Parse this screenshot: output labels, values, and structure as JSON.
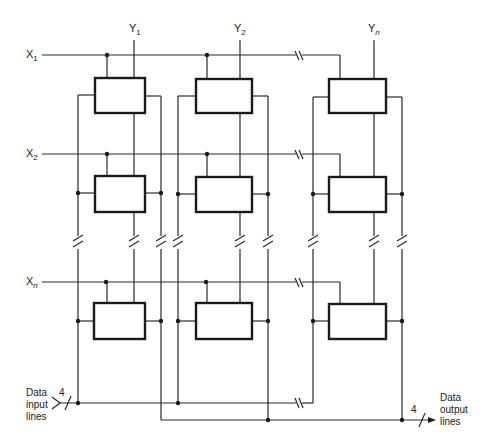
{
  "diagram": {
    "row_labels": [
      {
        "letter": "X",
        "sub": "1"
      },
      {
        "letter": "X",
        "sub": "2"
      },
      {
        "letter": "X",
        "sub": "n"
      }
    ],
    "column_labels": [
      {
        "letter": "Y",
        "sub": "1"
      },
      {
        "letter": "Y",
        "sub": "2"
      },
      {
        "letter": "Y",
        "sub": "n"
      }
    ],
    "data_input": {
      "lines": [
        "Data",
        "input",
        "lines"
      ],
      "width": "4"
    },
    "data_output": {
      "lines": [
        "Data",
        "output",
        "lines"
      ],
      "width": "4"
    },
    "cells": {
      "rows": 3,
      "columns": 3,
      "note": "rows X1, X2, Xn × columns Y1, Y2, Yn; breaks indicate omitted rows/columns"
    },
    "colors": {
      "line": "#2a2a2a",
      "background": "#ffffff"
    }
  }
}
